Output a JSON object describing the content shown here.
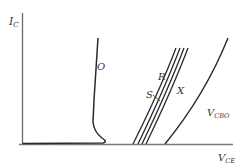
{
  "diagram": {
    "axes": {
      "y_label_main": "I",
      "y_label_sub": "C",
      "x_label_main": "V",
      "x_label_sub": "CE"
    },
    "curves": [
      {
        "id": "O",
        "label": "O"
      },
      {
        "id": "S",
        "label": "S"
      },
      {
        "id": "R",
        "label": "R"
      },
      {
        "id": "X",
        "label": "X"
      },
      {
        "id": "VCBO",
        "label_main": "V",
        "label_sub": "CBO"
      }
    ],
    "colors": {
      "curve": "#2a2a2a",
      "axis": "#6a6a6a",
      "text": "#333333"
    }
  }
}
